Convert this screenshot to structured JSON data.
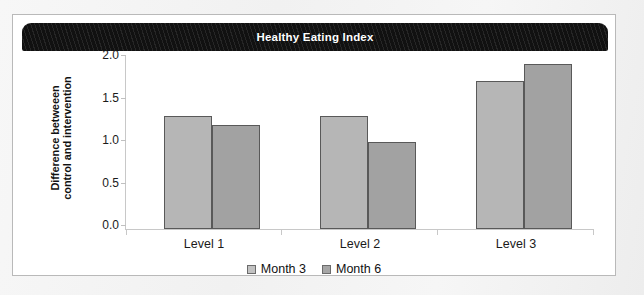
{
  "chart_data": {
    "type": "bar",
    "title": "Healthy Eating Index",
    "xlabel": "",
    "ylabel": "Difference betweeen control and intervention",
    "ylabel_lines": [
      "Difference betweeen",
      "control and intervention"
    ],
    "categories": [
      "Level 1",
      "Level 2",
      "Level 3"
    ],
    "series": [
      {
        "name": "Month 3",
        "values": [
          1.3,
          1.3,
          1.7
        ],
        "color": "#b6b6b6"
      },
      {
        "name": "Month 6",
        "values": [
          1.2,
          1.0,
          1.9
        ],
        "color": "#a2a2a2"
      }
    ],
    "ylim": [
      0.0,
      2.0
    ],
    "ytick_labels": [
      "0.0",
      "0.5",
      "1.0",
      "1.5",
      "2.0"
    ],
    "ytick_values": [
      0.0,
      0.5,
      1.0,
      1.5,
      2.0
    ],
    "grid": false,
    "legend_position": "bottom-center"
  },
  "panel": {
    "title_bar_color": "#111111",
    "title_text_color": "#ffffff",
    "background": "#ffffff",
    "border_color": "#b9b9b9"
  }
}
